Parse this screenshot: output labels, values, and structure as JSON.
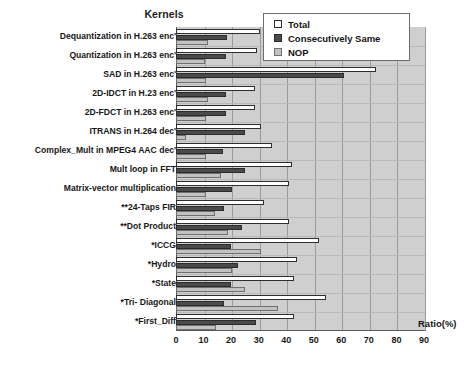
{
  "chart_data": {
    "type": "bar",
    "orientation": "horizontal",
    "title": "",
    "xlabel": "Ratio(%)",
    "ylabel": "Kernels",
    "xlim": [
      0,
      90
    ],
    "xticks": [
      0,
      10,
      20,
      30,
      40,
      50,
      60,
      70,
      80,
      90
    ],
    "grid": true,
    "legend_position": "top-right",
    "categories": [
      "Dequantization in H.263 enc'",
      "Quantization in H.263 enc'",
      "SAD in H.263 enc'",
      "2D-IDCT in H.23 enc'",
      "2D-FDCT in H.263 enc'",
      "ITRANS  in H.264 dec'",
      "Complex_Mult  in MPEG4 AAC dec'",
      "Mult loop in FFT",
      "Matrix-vector multiplication",
      "**24-Taps FIR",
      "**Dot Product",
      "*ICCG",
      "*Hydro",
      "*State",
      "*Tri- Diagonal",
      "*First_Diff"
    ],
    "series": [
      {
        "name": "Total",
        "color": "#ffffff",
        "values": [
          30.5,
          29.5,
          72.5,
          28.5,
          28.5,
          31.0,
          35.0,
          42.0,
          41.0,
          32.0,
          41.0,
          52.0,
          44.0,
          43.0,
          54.5,
          43.0
        ]
      },
      {
        "name": "Consecutively Same",
        "color": "#4a4a4a",
        "values": [
          18.5,
          18.0,
          61.0,
          18.0,
          18.0,
          25.0,
          17.0,
          25.0,
          20.5,
          17.5,
          24.0,
          20.0,
          22.5,
          20.0,
          17.5,
          29.0
        ]
      },
      {
        "name": "NOP",
        "color": "#c2c2c2",
        "values": [
          11.5,
          10.5,
          11.0,
          11.5,
          11.0,
          3.5,
          11.0,
          16.5,
          11.0,
          14.0,
          19.0,
          31.0,
          20.5,
          25.0,
          37.0,
          14.5
        ]
      }
    ]
  },
  "legend": {
    "items": [
      {
        "label": "Total",
        "swatch": "total"
      },
      {
        "label": "Consecutively Same",
        "swatch": "same"
      },
      {
        "label": "NOP",
        "swatch": "nop"
      }
    ]
  }
}
